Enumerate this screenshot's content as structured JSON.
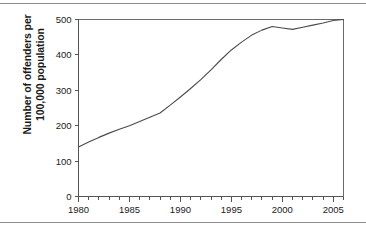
{
  "figure": {
    "top_rule": "horizontal-rule",
    "bottom_rule": "horizontal-rule"
  },
  "chart_data": {
    "type": "line",
    "title": "",
    "xlabel": "",
    "ylabel": "Number of offenders per\n100,000 population",
    "xlim": [
      1980,
      2006
    ],
    "ylim": [
      0,
      500
    ],
    "grid": false,
    "legend": "none",
    "y_ticks": [
      0,
      100,
      200,
      300,
      400,
      500
    ],
    "y_tick_labels": [
      "0",
      "100",
      "200",
      "300",
      "400",
      "500"
    ],
    "x_ticks": [
      1980,
      1985,
      1990,
      1995,
      2000,
      2005
    ],
    "x_tick_labels": [
      "1980",
      "1985",
      "1990",
      "1995",
      "2000",
      "2005"
    ],
    "x_minor_tick_interval": 1,
    "line_color": "#4a4a4a",
    "series": [
      {
        "name": "Offenders per 100,000 population",
        "x": [
          1980,
          1981,
          1982,
          1983,
          1984,
          1985,
          1986,
          1987,
          1988,
          1989,
          1990,
          1991,
          1992,
          1993,
          1994,
          1995,
          1996,
          1997,
          1998,
          1999,
          2000,
          2001,
          2002,
          2003,
          2004,
          2005,
          2006
        ],
        "values": [
          140,
          154,
          167,
          179,
          190,
          200,
          212,
          224,
          236,
          258,
          281,
          305,
          330,
          358,
          387,
          414,
          436,
          456,
          470,
          480,
          476,
          472,
          478,
          484,
          490,
          497,
          500
        ]
      }
    ]
  }
}
